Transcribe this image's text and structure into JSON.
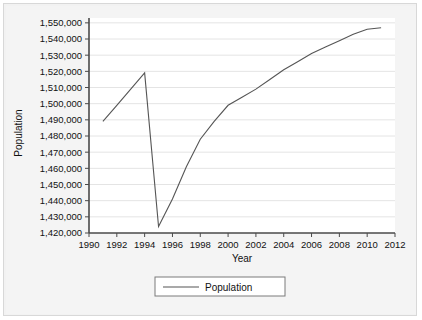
{
  "chart_data": {
    "type": "line",
    "title": "",
    "xlabel": "Year",
    "ylabel": "Population",
    "xlim": [
      1990,
      2012
    ],
    "ylim": [
      1420000,
      1553000
    ],
    "grid": true,
    "legend_position": "bottom",
    "series": [
      {
        "name": "Population",
        "color": "#555555",
        "x": [
          1991,
          1992,
          1993,
          1994,
          1995,
          1996,
          1997,
          1998,
          1999,
          2000,
          2001,
          2002,
          2003,
          2004,
          2005,
          2006,
          2007,
          2008,
          2009,
          2010,
          2011
        ],
        "values": [
          1489000,
          1499000,
          1509000,
          1519000,
          1424000,
          1441000,
          1461000,
          1478000,
          1489000,
          1499000,
          1504000,
          1509000,
          1515000,
          1521000,
          1526000,
          1531000,
          1535000,
          1539000,
          1543000,
          1546000,
          1547000
        ]
      }
    ],
    "xticks": [
      1990,
      1992,
      1994,
      1996,
      1998,
      2000,
      2002,
      2004,
      2006,
      2008,
      2010,
      2012
    ],
    "xtick_labels": [
      "1990",
      "1992",
      "1994",
      "1996",
      "1998",
      "2000",
      "2002",
      "2004",
      "2006",
      "2008",
      "2010",
      "2012"
    ],
    "yticks": [
      1420000,
      1430000,
      1440000,
      1450000,
      1460000,
      1470000,
      1480000,
      1490000,
      1500000,
      1510000,
      1520000,
      1530000,
      1540000,
      1550000
    ],
    "ytick_labels": [
      "1,420,000",
      "1,430,000",
      "1,440,000",
      "1,450,000",
      "1,460,000",
      "1,470,000",
      "1,480,000",
      "1,490,000",
      "1,500,000",
      "1,510,000",
      "1,520,000",
      "1,530,000",
      "1,540,000",
      "1,550,000"
    ],
    "legend_entries": [
      "Population"
    ]
  },
  "colors": {
    "line": "#555555",
    "grid": "#e4e4e4",
    "axis": "#4a4a4a",
    "plot_background": "#ffffff",
    "figure_background": "#f2f2f2",
    "text": "#111111"
  }
}
